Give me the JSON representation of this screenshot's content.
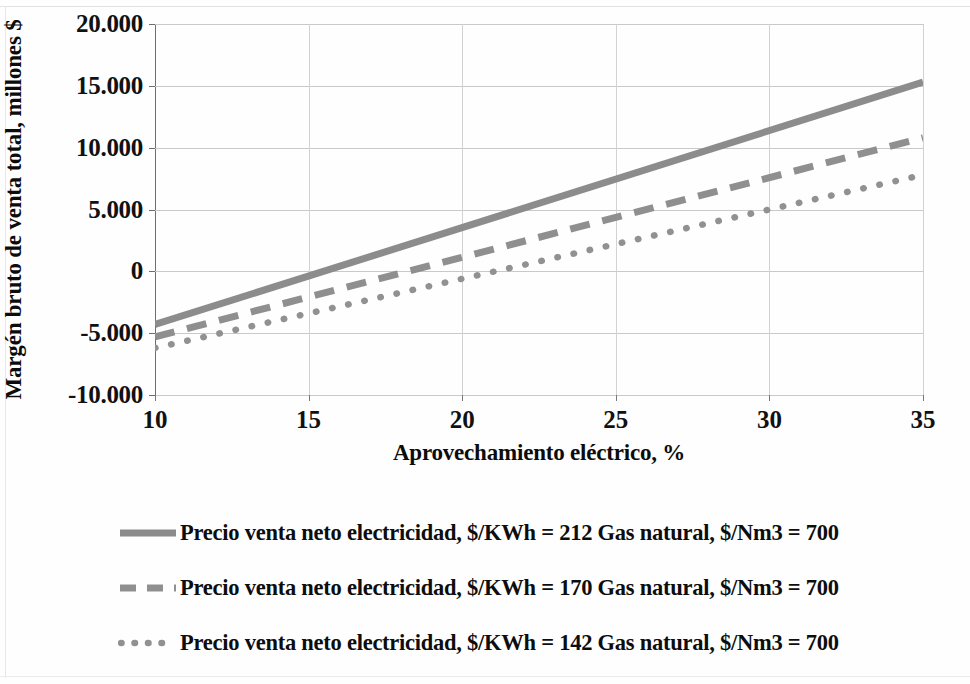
{
  "chart_data": {
    "type": "line",
    "title": "",
    "xlabel": "Aprovechamiento eléctrico, %",
    "ylabel": "Margén bruto de venta total, millones $",
    "xlim": [
      10,
      35
    ],
    "ylim": [
      -10000,
      20000
    ],
    "xticks": [
      "10",
      "15",
      "20",
      "25",
      "30",
      "35"
    ],
    "yticks": [
      "20.000",
      "15.000",
      "10.000",
      "5.000",
      "0",
      "-5.000",
      "-10.000"
    ],
    "ytick_values": [
      20000,
      15000,
      10000,
      5000,
      0,
      -5000,
      -10000
    ],
    "xtick_values": [
      10,
      15,
      20,
      25,
      30,
      35
    ],
    "grid": true,
    "legend_position": "bottom",
    "x": [
      10,
      35
    ],
    "series": [
      {
        "name": "Precio venta neto electricidad, $/KWh = 212 Gas natural, $/Nm3 =  700",
        "style": "solid",
        "color": "#8c8c8c",
        "width": 7,
        "values": [
          -4300,
          15300
        ]
      },
      {
        "name": "Precio venta neto electricidad, $/KWh = 170 Gas natural, $/Nm3 =  700",
        "style": "dashed",
        "color": "#8f8f8f",
        "width": 7,
        "values": [
          -5300,
          10800
        ]
      },
      {
        "name": "Precio venta neto electricidad, $/KWh = 142 Gas natural, $/Nm3 =  700",
        "style": "dotted",
        "color": "#919191",
        "width": 7,
        "values": [
          -6200,
          7800
        ]
      }
    ]
  },
  "axes": {
    "x_title": "Aprovechamiento eléctrico, %",
    "y_title": "Margén bruto de venta total, millones $"
  },
  "ytick_labels": {
    "t0": "20.000",
    "t1": "15.000",
    "t2": "10.000",
    "t3": "5.000",
    "t4": "0",
    "t5": "-5.000",
    "t6": "-10.000"
  },
  "xtick_labels": {
    "t0": "10",
    "t1": "15",
    "t2": "20",
    "t3": "25",
    "t4": "30",
    "t5": "35"
  },
  "legend": {
    "items": [
      {
        "label": "Precio venta neto electricidad, $/KWh = 212 Gas natural, $/Nm3 =  700",
        "style": "solid"
      },
      {
        "label": "Precio venta neto electricidad, $/KWh = 170 Gas natural, $/Nm3 =  700",
        "style": "dashed"
      },
      {
        "label": "Precio venta neto electricidad, $/KWh = 142 Gas natural, $/Nm3 =  700",
        "style": "dotted"
      }
    ]
  },
  "colors": {
    "series_gray": "#8c8c8c",
    "gridline": "#c9c9c9",
    "axis": "#6e6e6e",
    "text": "#0d0d0d"
  }
}
